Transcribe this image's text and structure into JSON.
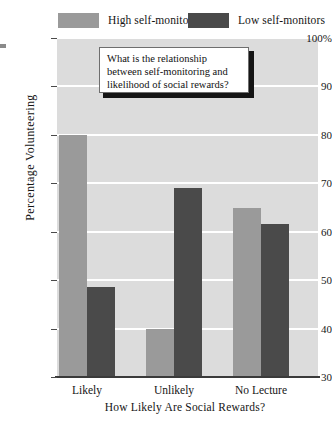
{
  "chart_data": {
    "type": "bar",
    "title": "",
    "xlabel": "How Likely Are Social Rewards?",
    "ylabel": "Percentage Volunteering",
    "categories": [
      "Likely",
      "Unlikely",
      "No Lecture"
    ],
    "series": [
      {
        "name": "High self-monitors",
        "color": "#9a9a9a",
        "values": [
          80,
          40,
          65
        ]
      },
      {
        "name": "Low self-monitors",
        "color": "#4a4a4a",
        "values": [
          48.5,
          69,
          61.5
        ]
      }
    ],
    "ylim": [
      30,
      100
    ],
    "ytick_labels": [
      "100%",
      "90",
      "80",
      "70",
      "60",
      "50",
      "40",
      "30"
    ],
    "ytick_values": [
      100,
      90,
      80,
      70,
      60,
      50,
      40,
      30
    ],
    "grid": true,
    "legend_position": "top",
    "plot_background": "#dcdcdc",
    "gridline_color": "#ffffff",
    "annotations": [
      {
        "name": "question-callout",
        "text": "What is the relationship between self-monitoring and likelihood of social rewards?"
      }
    ]
  },
  "legend": {
    "entries": [
      {
        "label": "High self-monitors"
      },
      {
        "label": "Low self-monitors"
      }
    ]
  },
  "axes": {
    "y_title": "Percentage Volunteering",
    "x_title": "How Likely Are Social Rewards?",
    "y_ticks": [
      "100%",
      "90",
      "80",
      "70",
      "60",
      "50",
      "40",
      "30"
    ],
    "x_ticks": [
      "Likely",
      "Unlikely",
      "No Lecture"
    ]
  },
  "callout": {
    "line1": "What is the relationship",
    "line2": "between self-monitoring and",
    "line3": "likelihood of social rewards?"
  }
}
